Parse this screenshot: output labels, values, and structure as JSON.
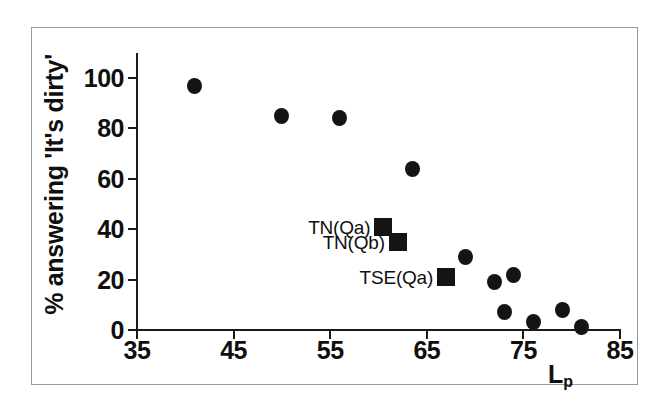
{
  "chart_data": {
    "type": "scatter",
    "title": "",
    "xlabel": "Lp",
    "xlabel_base": "L",
    "xlabel_sub": "p",
    "ylabel": "% answering 'It's dirty'",
    "xlim": [
      35,
      85
    ],
    "ylim": [
      0,
      100
    ],
    "xticks": [
      35,
      45,
      55,
      65,
      75,
      85
    ],
    "yticks": [
      0,
      20,
      40,
      60,
      80,
      100
    ],
    "grid": false,
    "legend": "none",
    "marker_color": "#141414",
    "series": [
      {
        "name": "survey-sites",
        "marker": "circle",
        "points": [
          {
            "x": 41,
            "y": 97
          },
          {
            "x": 50,
            "y": 85
          },
          {
            "x": 56,
            "y": 84
          },
          {
            "x": 63.5,
            "y": 64
          },
          {
            "x": 69,
            "y": 29
          },
          {
            "x": 72,
            "y": 19
          },
          {
            "x": 74,
            "y": 22
          },
          {
            "x": 73,
            "y": 7
          },
          {
            "x": 76,
            "y": 3
          },
          {
            "x": 79,
            "y": 8
          },
          {
            "x": 81,
            "y": 1
          }
        ]
      },
      {
        "name": "annotated-sites",
        "marker": "square",
        "points": [
          {
            "x": 60.5,
            "y": 41,
            "label": "TN(Qa)"
          },
          {
            "x": 62,
            "y": 35,
            "label": "TN(Qb)"
          },
          {
            "x": 67,
            "y": 21,
            "label": "TSE(Qa)"
          }
        ]
      }
    ]
  }
}
